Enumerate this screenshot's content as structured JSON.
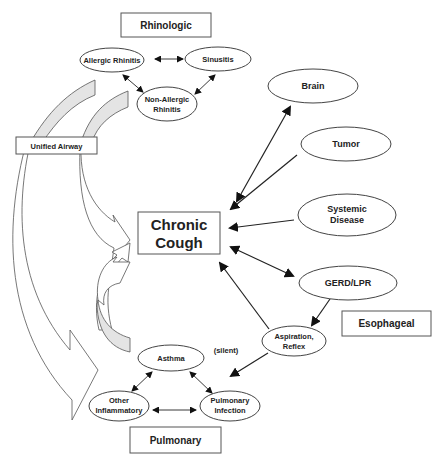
{
  "categories": {
    "rhinologic": "Rhinologic",
    "unified_airway": "Unified Airway",
    "esophageal": "Esophageal",
    "pulmonary": "Pulmonary"
  },
  "center": {
    "line1": "Chronic",
    "line2": "Cough"
  },
  "rhinologic_nodes": {
    "allergic_rhinitis": "Allergic Rhinitis",
    "sinusitis": "Sinusitis",
    "non_allergic_line1": "Non-Allergic",
    "non_allergic_line2": "Rhinitis"
  },
  "right_nodes": {
    "brain": "Brain",
    "tumor": "Tumor",
    "systemic_line1": "Systemic",
    "systemic_line2": "Disease",
    "gerd": "GERD/LPR",
    "aspiration_line1": "Aspiration,",
    "aspiration_line2": "Reflex"
  },
  "pulmonary_nodes": {
    "asthma": "Asthma",
    "other_line1": "Other",
    "other_line2": "Inflammatory",
    "infection_line1": "Pulmonary",
    "infection_line2": "Infection"
  },
  "annotations": {
    "silent": "(silent)"
  },
  "colors": {
    "band_fill": "#e4e4e4",
    "stroke": "#444444",
    "text": "#222222"
  }
}
